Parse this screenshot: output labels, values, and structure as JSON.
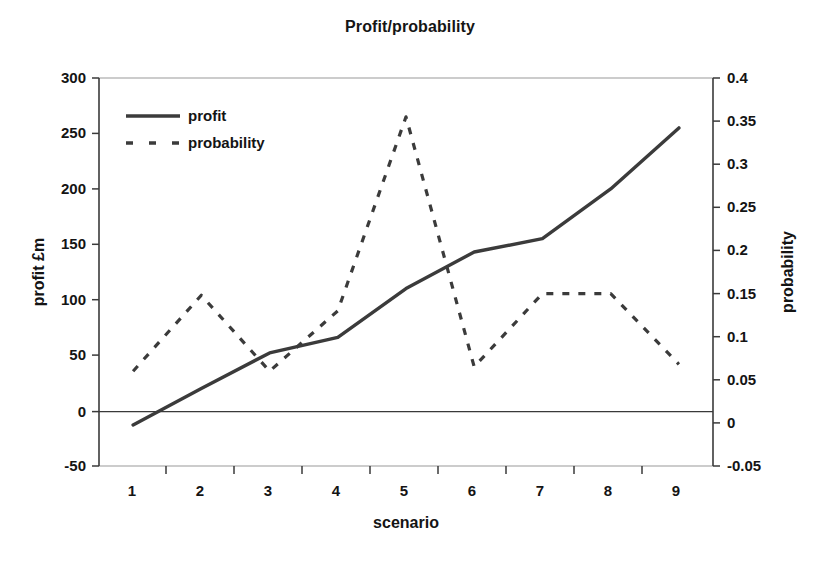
{
  "chart_data": {
    "type": "line",
    "title": "Profit/probability",
    "xlabel": "scenario",
    "ylabel": "profit £m",
    "y2label": "probability",
    "categories": [
      "1",
      "2",
      "3",
      "4",
      "5",
      "6",
      "7",
      "8",
      "9"
    ],
    "grid": false,
    "legend_position": "top-left inside plot",
    "ylim": [
      -50,
      300
    ],
    "y2lim": [
      -0.05,
      0.4
    ],
    "yticks": [
      "300",
      "250",
      "200",
      "150",
      "100",
      "50",
      "0",
      "-50"
    ],
    "ytick_values": [
      300,
      250,
      200,
      150,
      100,
      50,
      0,
      -50
    ],
    "y2ticks": [
      "0.4",
      "0.35",
      "0.3",
      "0.25",
      "0.2",
      "0.15",
      "0.1",
      "0.05",
      "0",
      "-0.05"
    ],
    "y2tick_values": [
      0.4,
      0.35,
      0.3,
      0.25,
      0.2,
      0.15,
      0.1,
      0.05,
      0,
      -0.05
    ],
    "series": [
      {
        "name": "profit",
        "axis": "left",
        "style": "solid",
        "color": "#3b3b3b",
        "values": [
          -13,
          20,
          52,
          66,
          110,
          143,
          155,
          200,
          255
        ]
      },
      {
        "name": "probability",
        "axis": "right",
        "style": "dashed",
        "color": "#3b3b3b",
        "values": [
          0.06,
          0.148,
          0.06,
          0.13,
          0.355,
          0.065,
          0.15,
          0.15,
          0.068
        ]
      }
    ]
  },
  "legend": {
    "items": [
      {
        "label": "profit",
        "style": "solid"
      },
      {
        "label": "probability",
        "style": "dashed"
      }
    ]
  }
}
